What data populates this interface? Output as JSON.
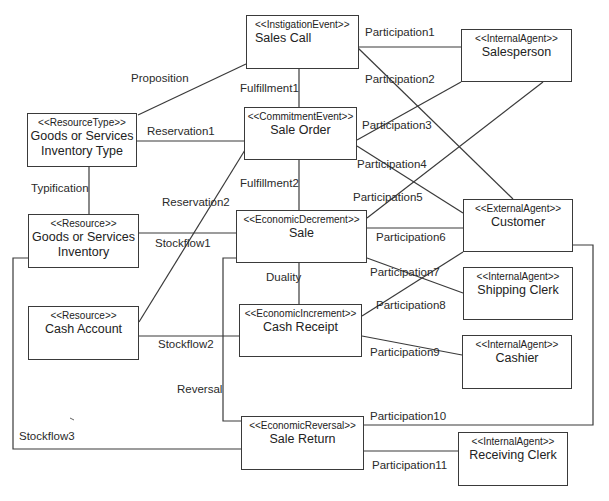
{
  "diagram": {
    "type": "REA model class diagram",
    "nodes": [
      {
        "id": "sales_call",
        "stereotype": "<<InstigationEvent>>",
        "name": "Sales Call"
      },
      {
        "id": "salesperson",
        "stereotype": "<<InternalAgent>>",
        "name": "Salesperson"
      },
      {
        "id": "goods_type",
        "stereotype": "<<ResourceType>>",
        "name": "Goods or Services",
        "name2": "Inventory Type"
      },
      {
        "id": "sale_order",
        "stereotype": "<<CommitmentEvent>>",
        "name": "Sale Order"
      },
      {
        "id": "goods_inventory",
        "stereotype": "<<Resource>>",
        "name": "Goods or Services",
        "name2": "Inventory"
      },
      {
        "id": "sale",
        "stereotype": "<<EconomicDecrement>>",
        "name": "Sale"
      },
      {
        "id": "customer",
        "stereotype": "<<ExternalAgent>>",
        "name": "Customer"
      },
      {
        "id": "shipping_clerk",
        "stereotype": "<<InternalAgent>>",
        "name": "Shipping Clerk"
      },
      {
        "id": "cash_account",
        "stereotype": "<<Resource>>",
        "name": "Cash Account"
      },
      {
        "id": "cash_receipt",
        "stereotype": "<<EconomicIncrement>>",
        "name": "Cash Receipt"
      },
      {
        "id": "cashier",
        "stereotype": "<<InternalAgent>>",
        "name": "Cashier"
      },
      {
        "id": "sale_return",
        "stereotype": "<<EconomicReversal>>",
        "name": "Sale Return"
      },
      {
        "id": "receiving_clerk",
        "stereotype": "<<InternalAgent>>",
        "name": "Receiving Clerk"
      }
    ],
    "edges": [
      {
        "label": "Proposition",
        "from": "goods_type",
        "to": "sales_call"
      },
      {
        "label": "Fulfillment1",
        "from": "sales_call",
        "to": "sale_order"
      },
      {
        "label": "Participation1",
        "from": "sales_call",
        "to": "salesperson"
      },
      {
        "label": "Participation2",
        "from": "sales_call",
        "to": "customer"
      },
      {
        "label": "Reservation1",
        "from": "goods_type",
        "to": "sale_order"
      },
      {
        "label": "Participation3",
        "from": "sale_order",
        "to": "salesperson"
      },
      {
        "label": "Participation4",
        "from": "sale_order",
        "to": "customer"
      },
      {
        "label": "Typification",
        "from": "goods_type",
        "to": "goods_inventory"
      },
      {
        "label": "Fulfillment2",
        "from": "sale_order",
        "to": "sale"
      },
      {
        "label": "Reservation2",
        "from": "cash_account",
        "to": "sale_order"
      },
      {
        "label": "Participation5",
        "from": "sale",
        "to": "salesperson"
      },
      {
        "label": "Stockflow1",
        "from": "goods_inventory",
        "to": "sale"
      },
      {
        "label": "Participation6",
        "from": "sale",
        "to": "customer"
      },
      {
        "label": "Duality",
        "from": "sale",
        "to": "cash_receipt"
      },
      {
        "label": "Participation7",
        "from": "sale",
        "to": "shipping_clerk"
      },
      {
        "label": "Participation8",
        "from": "cash_receipt",
        "to": "customer"
      },
      {
        "label": "Stockflow2",
        "from": "cash_account",
        "to": "cash_receipt"
      },
      {
        "label": "Participation9",
        "from": "cash_receipt",
        "to": "cashier"
      },
      {
        "label": "Reversal",
        "from": "sale",
        "to": "sale_return"
      },
      {
        "label": "Participation10",
        "from": "sale_return",
        "to": "customer"
      },
      {
        "label": "Stockflow3",
        "from": "goods_inventory",
        "to": "sale_return"
      },
      {
        "label": "Participation11",
        "from": "sale_return",
        "to": "receiving_clerk"
      }
    ]
  },
  "boxes": {
    "sales_call": {
      "stereo": "<<InstigationEvent>>",
      "name": "Sales Call"
    },
    "salesperson": {
      "stereo": "<<InternalAgent>>",
      "name": "Salesperson"
    },
    "goods_type": {
      "stereo": "<<ResourceType>>",
      "name1": "Goods or Services",
      "name2": "Inventory Type"
    },
    "sale_order": {
      "stereo": "<<CommitmentEvent>>",
      "name": "Sale Order"
    },
    "goods_inventory": {
      "stereo": "<<Resource>>",
      "name1": "Goods or Services",
      "name2": "Inventory"
    },
    "sale": {
      "stereo": "<<EconomicDecrement>>",
      "name": "Sale"
    },
    "customer": {
      "stereo": "<<ExternalAgent>>",
      "name": "Customer"
    },
    "shipping_clerk": {
      "stereo": "<<InternalAgent>>",
      "name": "Shipping Clerk"
    },
    "cash_account": {
      "stereo": "<<Resource>>",
      "name": "Cash Account"
    },
    "cash_receipt": {
      "stereo": "<<EconomicIncrement>>",
      "name": "Cash Receipt"
    },
    "cashier": {
      "stereo": "<<InternalAgent>>",
      "name": "Cashier"
    },
    "sale_return": {
      "stereo": "<<EconomicReversal>>",
      "name": "Sale Return"
    },
    "receiving_clerk": {
      "stereo": "<<InternalAgent>>",
      "name": "Receiving Clerk"
    }
  },
  "labels": {
    "proposition": "Proposition",
    "fulfillment1": "Fulfillment1",
    "participation1": "Participation1",
    "participation2": "Participation2",
    "reservation1": "Reservation1",
    "participation3": "Participation3",
    "participation4": "Participation4",
    "typification": "Typification",
    "fulfillment2": "Fulfillment2",
    "reservation2": "Reservation2",
    "participation5": "Participation5",
    "stockflow1": "Stockflow1",
    "participation6": "Participation6",
    "duality": "Duality",
    "participation7": "Participation7",
    "participation8": "Participation8",
    "stockflow2": "Stockflow2",
    "participation9": "Participation9",
    "reversal": "Reversal",
    "participation10": "Participation10",
    "stockflow3": "Stockflow3",
    "participation11": "Participation11"
  }
}
